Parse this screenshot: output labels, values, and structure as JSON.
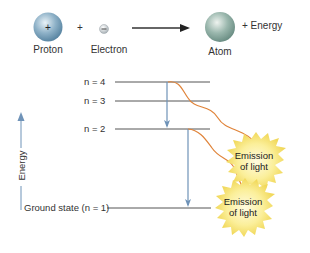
{
  "reaction": {
    "proton_label": "Proton",
    "proton_symbol": "+",
    "plus_sign": "+",
    "electron_label": "Electron",
    "electron_symbol": "−",
    "atom_label": "Atom",
    "energy_output": "+  Energy"
  },
  "levels": [
    {
      "label": "n = 4"
    },
    {
      "label": "n = 3"
    },
    {
      "label": "n = 2"
    },
    {
      "label": "Ground state (n = 1)"
    }
  ],
  "axis": {
    "label": "Energy"
  },
  "emissions": [
    {
      "line1": "Emission",
      "line2": "of light"
    },
    {
      "line1": "Emission",
      "line2": "of light"
    }
  ],
  "colors": {
    "transition_arrow": "#6f93b8",
    "photon_path": "#e0843a",
    "starburst": "#f7e77a",
    "level_line": "#555555",
    "proton": "#7fa6c0",
    "atom": "#8fb0a8"
  }
}
